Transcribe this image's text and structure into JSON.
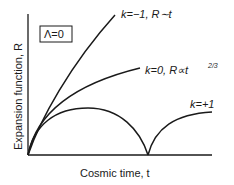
{
  "diagram": {
    "condition_box": "Λ=0",
    "y_axis_label": "Expansion function, R",
    "x_axis_label": "Cosmic time, t",
    "curves": [
      {
        "name": "open",
        "k": "-1",
        "label": "k=−1, R∼t"
      },
      {
        "name": "flat",
        "k": "0",
        "label": "k=0, R∝t",
        "label_exponent": "2/3"
      },
      {
        "name": "closed",
        "k": "+1",
        "label": "k=+1"
      }
    ]
  }
}
